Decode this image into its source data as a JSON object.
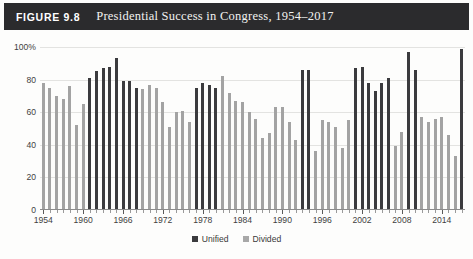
{
  "figure": {
    "label": "FIGURE 9.8",
    "title": "Presidential Success in Congress, 1954–2017"
  },
  "legend": {
    "items": [
      {
        "label": "Unified",
        "color": "#3b3b3e",
        "key": "unified"
      },
      {
        "label": "Divided",
        "color": "#a3a3a3",
        "key": "divided"
      }
    ]
  },
  "axes": {
    "y_ticks": [
      "0",
      "20",
      "40",
      "60",
      "80",
      "100%"
    ],
    "y_values": [
      0,
      20,
      40,
      60,
      80,
      100
    ],
    "x_ticks": [
      "1954",
      "1960",
      "1966",
      "1972",
      "1978",
      "1984",
      "1990",
      "1996",
      "2002",
      "2008",
      "2014"
    ],
    "x_tick_values": [
      1954,
      1960,
      1966,
      1972,
      1978,
      1984,
      1990,
      1996,
      2002,
      2008,
      2014
    ]
  },
  "chart_data": {
    "type": "bar",
    "title": "Presidential Success in Congress, 1954–2017",
    "xlabel": "",
    "ylabel": "",
    "ylim": [
      0,
      100
    ],
    "grid": true,
    "legend_position": "bottom-center",
    "categories": [
      "1954",
      "1955",
      "1956",
      "1957",
      "1958",
      "1959",
      "1960",
      "1961",
      "1962",
      "1963",
      "1964",
      "1965",
      "1966",
      "1967",
      "1968",
      "1969",
      "1970",
      "1971",
      "1972",
      "1973",
      "1974",
      "1975",
      "1976",
      "1977",
      "1978",
      "1979",
      "1980",
      "1981",
      "1982",
      "1983",
      "1984",
      "1985",
      "1986",
      "1987",
      "1988",
      "1989",
      "1990",
      "1991",
      "1992",
      "1993",
      "1994",
      "1995",
      "1996",
      "1997",
      "1998",
      "1999",
      "2000",
      "2001",
      "2002",
      "2003",
      "2004",
      "2005",
      "2006",
      "2007",
      "2008",
      "2009",
      "2010",
      "2011",
      "2012",
      "2013",
      "2014",
      "2015",
      "2016",
      "2017"
    ],
    "values": [
      78,
      75,
      70,
      68,
      76,
      52,
      65,
      81,
      85,
      87,
      88,
      93,
      79,
      79,
      75,
      74,
      77,
      75,
      66,
      51,
      60,
      61,
      54,
      75,
      78,
      77,
      75,
      82,
      72,
      67,
      66,
      60,
      56,
      44,
      47,
      63,
      63,
      54,
      43,
      86,
      86,
      36,
      55,
      54,
      51,
      38,
      55,
      87,
      88,
      78,
      73,
      78,
      81,
      39,
      48,
      97,
      86,
      57,
      54,
      56,
      57,
      46,
      33,
      99
    ],
    "series_key": [
      "divided",
      "divided",
      "divided",
      "divided",
      "divided",
      "divided",
      "divided",
      "unified",
      "unified",
      "unified",
      "unified",
      "unified",
      "unified",
      "unified",
      "unified",
      "divided",
      "divided",
      "divided",
      "divided",
      "divided",
      "divided",
      "divided",
      "divided",
      "unified",
      "unified",
      "unified",
      "unified",
      "divided",
      "divided",
      "divided",
      "divided",
      "divided",
      "divided",
      "divided",
      "divided",
      "divided",
      "divided",
      "divided",
      "divided",
      "unified",
      "unified",
      "divided",
      "divided",
      "divided",
      "divided",
      "divided",
      "divided",
      "unified",
      "unified",
      "unified",
      "unified",
      "unified",
      "unified",
      "divided",
      "divided",
      "unified",
      "unified",
      "divided",
      "divided",
      "divided",
      "divided",
      "divided",
      "divided",
      "unified"
    ],
    "series": [
      {
        "name": "Unified",
        "color": "#3b3b3e",
        "points": [
          {
            "x": 1961,
            "y": 81
          },
          {
            "x": 1962,
            "y": 85
          },
          {
            "x": 1963,
            "y": 87
          },
          {
            "x": 1964,
            "y": 88
          },
          {
            "x": 1965,
            "y": 93
          },
          {
            "x": 1966,
            "y": 79
          },
          {
            "x": 1967,
            "y": 79
          },
          {
            "x": 1968,
            "y": 75
          },
          {
            "x": 1977,
            "y": 75
          },
          {
            "x": 1978,
            "y": 78
          },
          {
            "x": 1979,
            "y": 77
          },
          {
            "x": 1980,
            "y": 75
          },
          {
            "x": 1993,
            "y": 86
          },
          {
            "x": 1994,
            "y": 86
          },
          {
            "x": 2001,
            "y": 87
          },
          {
            "x": 2002,
            "y": 88
          },
          {
            "x": 2003,
            "y": 78
          },
          {
            "x": 2004,
            "y": 73
          },
          {
            "x": 2005,
            "y": 78
          },
          {
            "x": 2006,
            "y": 81
          },
          {
            "x": 2009,
            "y": 97
          },
          {
            "x": 2010,
            "y": 86
          },
          {
            "x": 2017,
            "y": 99
          }
        ]
      },
      {
        "name": "Divided",
        "color": "#a3a3a3",
        "points": [
          {
            "x": 1954,
            "y": 78
          },
          {
            "x": 1955,
            "y": 75
          },
          {
            "x": 1956,
            "y": 70
          },
          {
            "x": 1957,
            "y": 68
          },
          {
            "x": 1958,
            "y": 76
          },
          {
            "x": 1959,
            "y": 52
          },
          {
            "x": 1960,
            "y": 65
          },
          {
            "x": 1969,
            "y": 74
          },
          {
            "x": 1970,
            "y": 77
          },
          {
            "x": 1971,
            "y": 75
          },
          {
            "x": 1972,
            "y": 66
          },
          {
            "x": 1973,
            "y": 51
          },
          {
            "x": 1974,
            "y": 60
          },
          {
            "x": 1975,
            "y": 61
          },
          {
            "x": 1976,
            "y": 54
          },
          {
            "x": 1981,
            "y": 82
          },
          {
            "x": 1982,
            "y": 72
          },
          {
            "x": 1983,
            "y": 67
          },
          {
            "x": 1984,
            "y": 66
          },
          {
            "x": 1985,
            "y": 60
          },
          {
            "x": 1986,
            "y": 56
          },
          {
            "x": 1987,
            "y": 44
          },
          {
            "x": 1988,
            "y": 47
          },
          {
            "x": 1989,
            "y": 63
          },
          {
            "x": 1990,
            "y": 63
          },
          {
            "x": 1991,
            "y": 54
          },
          {
            "x": 1992,
            "y": 43
          },
          {
            "x": 1995,
            "y": 36
          },
          {
            "x": 1996,
            "y": 55
          },
          {
            "x": 1997,
            "y": 54
          },
          {
            "x": 1998,
            "y": 51
          },
          {
            "x": 1999,
            "y": 38
          },
          {
            "x": 2000,
            "y": 55
          },
          {
            "x": 2007,
            "y": 39
          },
          {
            "x": 2008,
            "y": 48
          },
          {
            "x": 2011,
            "y": 57
          },
          {
            "x": 2012,
            "y": 54
          },
          {
            "x": 2013,
            "y": 56
          },
          {
            "x": 2014,
            "y": 57
          },
          {
            "x": 2015,
            "y": 46
          },
          {
            "x": 2016,
            "y": 33
          }
        ]
      }
    ]
  },
  "colors": {
    "title_bar": "#2b2b2d",
    "unified": "#3b3b3e",
    "divided": "#a3a3a3",
    "gridline": "#e3e3e1",
    "axis": "#8c8c8c"
  }
}
